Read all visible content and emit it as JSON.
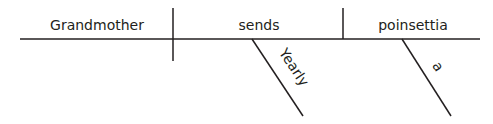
{
  "diagram": {
    "type": "sentence-diagram",
    "style": "Reed-Kellogg",
    "sentence_words": {
      "subject": "Grandmother",
      "verb": "sends",
      "direct_object": "poinsettia",
      "verb_modifier": "Yearly",
      "object_modifier": "a"
    },
    "colors": {
      "ink": "#231f20",
      "background": "#ffffff"
    }
  }
}
